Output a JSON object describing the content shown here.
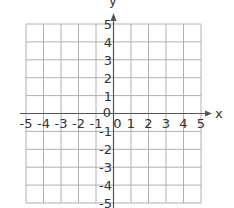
{
  "chart_data": {
    "type": "scatter",
    "title": "",
    "xlabel": "x",
    "ylabel": "y",
    "xlim": [
      -5,
      5
    ],
    "ylim": [
      -5,
      5
    ],
    "grid": true,
    "x_ticks": [
      "-5",
      "-4",
      "-3",
      "-2",
      "-1",
      "0",
      "1",
      "2",
      "3",
      "4",
      "5"
    ],
    "y_ticks": [
      "5",
      "4",
      "3",
      "2",
      "1",
      "0",
      "-1",
      "-2",
      "-3",
      "-4",
      "-5"
    ],
    "series": [],
    "legend": null
  },
  "colors": {
    "grid": "#b0b0b0",
    "axis": "#555555",
    "text": "#333333"
  }
}
